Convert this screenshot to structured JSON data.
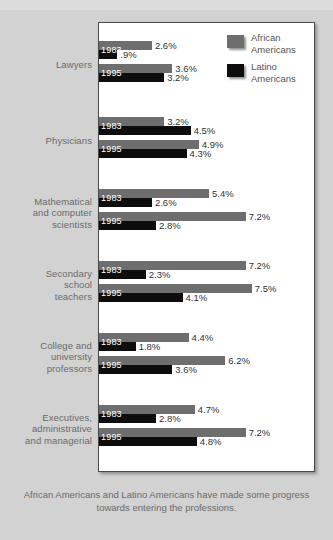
{
  "caption": "African Americans and Latino Americans have made some progress towards entering the professions.",
  "colors": {
    "african_american": "#6e6e6e",
    "latino_american": "#0d0d0d",
    "background": "#d2d2d2",
    "panel": "#ffffff",
    "label_text": "#6a6a6a"
  },
  "legend": {
    "items": [
      {
        "label_line1": "African",
        "label_line2": "Americans",
        "swatch": "gray"
      },
      {
        "label_line1": "Latino",
        "label_line2": "Americans",
        "swatch": "black"
      }
    ]
  },
  "chart_data": {
    "type": "bar",
    "orientation": "horizontal",
    "title": "",
    "subtitle": "",
    "xlabel": "",
    "ylabel": "",
    "xlim": [
      0,
      8.2
    ],
    "grid": false,
    "legend_position": "top-right",
    "value_suffix": "%",
    "years": [
      "1983",
      "1995"
    ],
    "legend_entries": [
      "African Americans",
      "Latino Americans"
    ],
    "categories": [
      "Lawyers",
      "Physicians",
      "Mathematical and computer scientists",
      "Secondary school teachers",
      "College and university professors",
      "Executives, administrative and managerial"
    ],
    "category_lines": [
      [
        "Lawyers"
      ],
      [
        "Physicians"
      ],
      [
        "Mathematical",
        "and computer",
        "scientists"
      ],
      [
        "Secondary",
        "school",
        "teachers"
      ],
      [
        "College and",
        "university",
        "professors"
      ],
      [
        "Executives,",
        "administrative",
        "and managerial"
      ]
    ],
    "groups": [
      {
        "category": "Lawyers",
        "bars": [
          {
            "year": "1983",
            "african_american": 2.6,
            "latino_american": 0.9,
            "african_american_label": "2.6%",
            "latino_american_label": ".9%"
          },
          {
            "year": "1995",
            "african_american": 3.6,
            "latino_american": 3.2,
            "african_american_label": "3.6%",
            "latino_american_label": "3.2%"
          }
        ]
      },
      {
        "category": "Physicians",
        "bars": [
          {
            "year": "1983",
            "african_american": 3.2,
            "latino_american": 4.5,
            "african_american_label": "3.2%",
            "latino_american_label": "4.5%"
          },
          {
            "year": "1995",
            "african_american": 4.9,
            "latino_american": 4.3,
            "african_american_label": "4.9%",
            "latino_american_label": "4.3%"
          }
        ]
      },
      {
        "category": "Mathematical and computer scientists",
        "bars": [
          {
            "year": "1983",
            "african_american": 5.4,
            "latino_american": 2.6,
            "african_american_label": "5.4%",
            "latino_american_label": "2.6%"
          },
          {
            "year": "1995",
            "african_american": 7.2,
            "latino_american": 2.8,
            "african_american_label": "7.2%",
            "latino_american_label": "2.8%"
          }
        ]
      },
      {
        "category": "Secondary school teachers",
        "bars": [
          {
            "year": "1983",
            "african_american": 7.2,
            "latino_american": 2.3,
            "african_american_label": "7.2%",
            "latino_american_label": "2.3%"
          },
          {
            "year": "1995",
            "african_american": 7.5,
            "latino_american": 4.1,
            "african_american_label": "7.5%",
            "latino_american_label": "4.1%"
          }
        ]
      },
      {
        "category": "College and university professors",
        "bars": [
          {
            "year": "1983",
            "african_american": 4.4,
            "latino_american": 1.8,
            "african_american_label": "4.4%",
            "latino_american_label": "1.8%"
          },
          {
            "year": "1995",
            "african_american": 6.2,
            "latino_american": 3.6,
            "african_american_label": "6.2%",
            "latino_american_label": "3.6%"
          }
        ]
      },
      {
        "category": "Executives, administrative and managerial",
        "bars": [
          {
            "year": "1983",
            "african_american": 4.7,
            "latino_american": 2.8,
            "african_american_label": "4.7%",
            "latino_american_label": "2.8%"
          },
          {
            "year": "1995",
            "african_american": 7.2,
            "latino_american": 4.8,
            "african_american_label": "7.2%",
            "latino_american_label": "4.8%"
          }
        ]
      }
    ]
  }
}
